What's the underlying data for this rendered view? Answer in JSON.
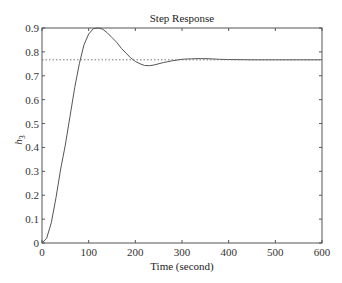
{
  "chart_data": {
    "type": "line",
    "title": "Step Response",
    "xlabel": "Time (second)",
    "ylabel": "h",
    "ylabel_subscript": "3",
    "xlim": [
      0,
      600
    ],
    "ylim": [
      0,
      0.9
    ],
    "xticks": [
      0,
      100,
      200,
      300,
      400,
      500,
      600
    ],
    "yticks": [
      0,
      0.1,
      0.2,
      0.3,
      0.4,
      0.5,
      0.6,
      0.7,
      0.8,
      0.9
    ],
    "ytick_labels": [
      "0",
      "0.1",
      "0.2",
      "0.3",
      "0.4",
      "0.5",
      "0.6",
      "0.7",
      "0.8",
      "0.9"
    ],
    "grid": false,
    "legend": null,
    "series": [
      {
        "name": "step response",
        "style": "solid",
        "color": "#555555",
        "x": [
          0,
          10,
          20,
          30,
          40,
          50,
          60,
          70,
          80,
          90,
          100,
          110,
          120,
          130,
          140,
          150,
          160,
          170,
          180,
          190,
          200,
          210,
          220,
          230,
          240,
          260,
          280,
          300,
          320,
          340,
          360,
          380,
          400,
          450,
          500,
          600
        ],
        "y": [
          0,
          0.02,
          0.085,
          0.19,
          0.31,
          0.41,
          0.53,
          0.65,
          0.75,
          0.83,
          0.875,
          0.897,
          0.9,
          0.895,
          0.88,
          0.86,
          0.84,
          0.815,
          0.795,
          0.775,
          0.76,
          0.75,
          0.743,
          0.742,
          0.745,
          0.755,
          0.763,
          0.769,
          0.771,
          0.772,
          0.771,
          0.769,
          0.768,
          0.767,
          0.767,
          0.767
        ]
      },
      {
        "name": "steady-state value",
        "style": "dotted",
        "color": "#777777",
        "x": [
          0,
          600
        ],
        "y": [
          0.767,
          0.767
        ]
      }
    ]
  }
}
